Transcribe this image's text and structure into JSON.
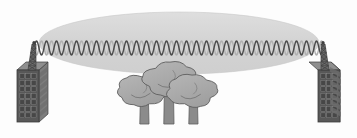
{
  "canvas": {
    "width": 357,
    "height": 138,
    "background_color": "#fdfdfd",
    "title": "Point-to-point radio link with Fresnel zone obstructed by trees"
  },
  "palette": {
    "background": "#fdfdfd",
    "fresnel_fill": "#d3d3d3",
    "fresnel_fill_light": "#dcdcdc",
    "fresnel_edge": "#c9c9c9",
    "wave_dark": "#4a4a4a",
    "wave_light": "#b0b0b0",
    "building_front": "#585858",
    "building_side": "#7d7d7d",
    "building_top": "#8e8e8e",
    "building_outline": "#3c3c3c",
    "window_dark": "#474747",
    "window_light": "#6e6e6e",
    "tower_mast": "#6b6b6b",
    "tower_mast_dark": "#3f3f3f",
    "tree_canopy": "#a9a9a9",
    "tree_canopy_shade": "#9a9a9a",
    "tree_outline": "#5e5e5e",
    "tree_trunk": "#8b8b8b",
    "tree_trunk_outline": "#5e5e5e"
  },
  "fresnel_zone": {
    "label": "fresnel-zone-ellipse",
    "center_x": 179,
    "center_y": 43,
    "radius_x": 140,
    "radius_y": 31,
    "fill": "#d3d3d3"
  },
  "signal_wave": {
    "label": "radio-signal-waveform",
    "start_x": 34,
    "end_x": 324,
    "baseline_y": 48,
    "amplitude": 7,
    "cycles": 29,
    "stroke_width": 1.4,
    "series": [
      {
        "name": "wave-dark",
        "color": "#4a4a4a",
        "phase_deg": 0
      },
      {
        "name": "wave-light",
        "color": "#b0b0b0",
        "phase_deg": 180
      }
    ]
  },
  "towers": [
    {
      "id": "left",
      "label": "Left transmitter tower",
      "side": "left",
      "building": {
        "front_x": 17,
        "front_y": 70,
        "front_w": 22,
        "front_h": 52,
        "depth_x": 9,
        "depth_y": -8,
        "window_rows": 7,
        "window_cols": 3
      },
      "mast": {
        "base_x": 32,
        "base_y": 70,
        "top_x": 34,
        "top_y": 44,
        "segments": 6,
        "half_width_bottom": 4,
        "half_width_top": 2
      }
    },
    {
      "id": "right",
      "label": "Right receiver tower",
      "side": "right",
      "building": {
        "front_x": 318,
        "front_y": 70,
        "front_w": 22,
        "front_h": 52,
        "depth_x": -9,
        "depth_y": -8,
        "window_rows": 7,
        "window_cols": 3
      },
      "mast": {
        "base_x": 325,
        "base_y": 70,
        "top_x": 323,
        "top_y": 44,
        "segments": 6,
        "half_width_bottom": 4,
        "half_width_top": 2
      }
    }
  ],
  "trees": [
    {
      "id": "tree-left",
      "label": "Obstructing tree left",
      "trunk_x": 141,
      "trunk_top": 92,
      "trunk_bottom": 124,
      "trunk_w": 8,
      "canopy_cx": 142,
      "canopy_cy": 90,
      "canopy_rx": 24,
      "canopy_ry": 16
    },
    {
      "id": "tree-center",
      "label": "Obstructing tree center tall",
      "trunk_x": 165,
      "trunk_top": 80,
      "trunk_bottom": 124,
      "trunk_w": 9,
      "canopy_cx": 170,
      "canopy_cy": 79,
      "canopy_rx": 27,
      "canopy_ry": 17
    },
    {
      "id": "tree-right",
      "label": "Obstructing tree right",
      "trunk_x": 190,
      "trunk_top": 94,
      "trunk_bottom": 124,
      "trunk_w": 8,
      "canopy_cx": 192,
      "canopy_cy": 91,
      "canopy_rx": 25,
      "canopy_ry": 16
    }
  ]
}
